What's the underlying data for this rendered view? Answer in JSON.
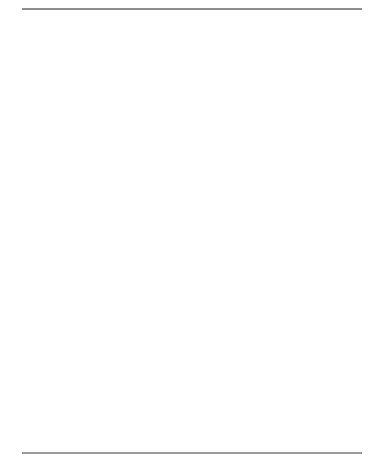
{
  "figure": {
    "top_rule": "horizontal-rule",
    "bottom_rule": "horizontal-rule"
  },
  "nodes": {
    "reps": [
      {
        "id": "rep1",
        "label": "REP 1",
        "x": 44,
        "y": 31,
        "w": 47,
        "h": 46
      },
      {
        "id": "rep2",
        "label": "REP 2",
        "x": 135,
        "y": 31,
        "w": 47,
        "h": 46
      },
      {
        "id": "rep3",
        "label": "REP 3",
        "x": 258,
        "y": 31,
        "w": 47,
        "h": 46
      },
      {
        "id": "custA",
        "label": "CUST A",
        "x": 11,
        "y": 114,
        "w": 42,
        "h": 44
      },
      {
        "id": "custB",
        "label": "CUST B",
        "x": 66,
        "y": 114,
        "w": 42,
        "h": 44
      },
      {
        "id": "custZ",
        "label": "CUST Z",
        "x": 137,
        "y": 114,
        "w": 42,
        "h": 44
      },
      {
        "id": "custD",
        "label": "CUST D",
        "x": 200,
        "y": 114,
        "w": 42,
        "h": 44
      },
      {
        "id": "custE",
        "label": "CUST E",
        "x": 254,
        "y": 114,
        "w": 44,
        "h": 44
      },
      {
        "id": "custF",
        "label": "CUST F",
        "x": 311,
        "y": 114,
        "w": 42,
        "h": 44
      },
      {
        "id": "or11",
        "label": "OR 11",
        "x": 72,
        "y": 203,
        "w": 42,
        "h": 43
      },
      {
        "id": "or25",
        "label": "OR 25",
        "x": 212,
        "y": 203,
        "w": 42,
        "h": 43
      },
      {
        "id": "or55",
        "label": "OR 55",
        "x": 296,
        "y": 203,
        "w": 42,
        "h": 43
      },
      {
        "id": "n5",
        "label": "5",
        "x": 43,
        "y": 290,
        "w": 38,
        "h": 40
      },
      {
        "id": "n2",
        "label": "2",
        "x": 103,
        "y": 290,
        "w": 38,
        "h": 40
      },
      {
        "id": "n3",
        "label": "3",
        "x": 211,
        "y": 290,
        "w": 38,
        "h": 40
      },
      {
        "id": "n6",
        "label": "6",
        "x": 272,
        "y": 290,
        "w": 38,
        "h": 40
      },
      {
        "id": "n8",
        "label": "8",
        "x": 333,
        "y": 290,
        "w": 38,
        "h": 40
      },
      {
        "id": "lock",
        "label": "LOCK",
        "x": 158,
        "y": 373,
        "w": 47,
        "h": 43
      },
      {
        "id": "gauge",
        "label": "GAUGE",
        "x": 246,
        "y": 373,
        "w": 47,
        "h": 43
      }
    ]
  },
  "edges": {
    "solid": [
      {
        "from": "rep1",
        "to": "custA"
      },
      {
        "from": "rep1",
        "to": "custB"
      },
      {
        "from": "rep2",
        "to": "custZ"
      },
      {
        "from": "rep3",
        "to": "custD"
      },
      {
        "from": "rep3",
        "to": "custE"
      },
      {
        "from": "rep3",
        "to": "custF"
      },
      {
        "from": "custB",
        "to": "or11"
      },
      {
        "from": "custE",
        "to": "or25"
      },
      {
        "from": "custE",
        "to": "or55"
      },
      {
        "from": "or11",
        "to": "n5"
      },
      {
        "from": "or11",
        "to": "n2"
      },
      {
        "from": "or25",
        "to": "n3"
      },
      {
        "from": "or55",
        "to": "n6"
      },
      {
        "from": "or55",
        "to": "n8"
      }
    ],
    "dashed": [
      {
        "from": "lock",
        "to": "n2"
      },
      {
        "from": "lock",
        "to": "n3"
      },
      {
        "from": "lock",
        "to": "n6"
      },
      {
        "from": "gauge",
        "to": "n5"
      },
      {
        "from": "gauge",
        "to": "n8"
      }
    ]
  },
  "style": {
    "solid_edge_color": "#1a1a1a",
    "dashed_edge_color": "#8a8a8a",
    "node_border_color": "#3a3a3a",
    "node_fill": "#ffffff",
    "rule_color": "#8d8d8d",
    "text_color": "#1a1a1a"
  }
}
